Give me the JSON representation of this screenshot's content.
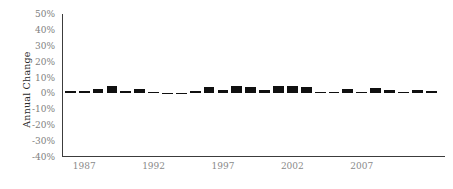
{
  "chart_data": {
    "type": "bar",
    "title": "",
    "xlabel": "",
    "ylabel": "Annual Change",
    "ylim": [
      -40,
      50
    ],
    "xlim": [
      1985.4,
      2013.0
    ],
    "grid": false,
    "legend": null,
    "ytick_labels": [
      "50%",
      "40%",
      "30%",
      "20%",
      "10%",
      "0%",
      "-10%",
      "-20%",
      "-30%",
      "-40%"
    ],
    "ytick_values": [
      50,
      40,
      30,
      20,
      10,
      0,
      -10,
      -20,
      -30,
      -40
    ],
    "xtick_labels": [
      "1987",
      "1992",
      "1997",
      "2002",
      "2007"
    ],
    "xtick_values": [
      1987,
      1992,
      1997,
      2002,
      2007
    ],
    "bar_color": "#101010",
    "axis_color": "#3c3c3c",
    "x": [
      1986,
      1987,
      1988,
      1989,
      1990,
      1991,
      1992,
      1993,
      1994,
      1995,
      1996,
      1997,
      1998,
      1999,
      2000,
      2001,
      2002,
      2003,
      2004,
      2005,
      2006,
      2007,
      2008,
      2009,
      2010,
      2011,
      2012
    ],
    "values": [
      1.5,
      1.6,
      2.6,
      5.0,
      1.7,
      2.9,
      0.9,
      0.4,
      0.3,
      1.7,
      3.9,
      2.1,
      4.6,
      4.3,
      2.3,
      4.4,
      4.4,
      4.2,
      0.7,
      0.6,
      2.9,
      1.0,
      3.3,
      1.9,
      1.1,
      2.4,
      1.3
    ],
    "categories": [
      "1986",
      "1987",
      "1988",
      "1989",
      "1990",
      "1991",
      "1992",
      "1993",
      "1994",
      "1995",
      "1996",
      "1997",
      "1998",
      "1999",
      "2000",
      "2001",
      "2002",
      "2003",
      "2004",
      "2005",
      "2006",
      "2007",
      "2008",
      "2009",
      "2010",
      "2011",
      "2012"
    ]
  }
}
